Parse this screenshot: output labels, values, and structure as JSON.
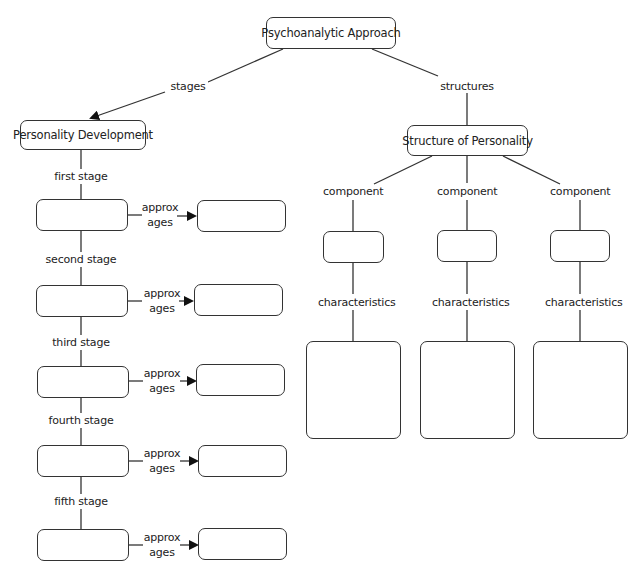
{
  "diagram": {
    "type": "concept-map",
    "root": {
      "label": "Psychoanalytic Approach"
    },
    "links": {
      "left": "stages",
      "right": "structures"
    },
    "left_branch": {
      "title": "Personality Development",
      "age_link_label_line1": "approx",
      "age_link_label_line2": "ages",
      "stages": [
        {
          "link_label": "first stage",
          "stage_value": "",
          "age_value": ""
        },
        {
          "link_label": "second stage",
          "stage_value": "",
          "age_value": ""
        },
        {
          "link_label": "third stage",
          "stage_value": "",
          "age_value": ""
        },
        {
          "link_label": "fourth stage",
          "stage_value": "",
          "age_value": ""
        },
        {
          "link_label": "fifth stage",
          "stage_value": "",
          "age_value": ""
        }
      ]
    },
    "right_branch": {
      "title": "Structure of Personality",
      "components": [
        {
          "link_label": "component",
          "component_value": "",
          "characteristics_label": "characteristics",
          "characteristics_value": ""
        },
        {
          "link_label": "component",
          "component_value": "",
          "characteristics_label": "characteristics",
          "characteristics_value": ""
        },
        {
          "link_label": "component",
          "component_value": "",
          "characteristics_label": "characteristics",
          "characteristics_value": ""
        }
      ]
    },
    "colors": {
      "line": "#333333",
      "box_border": "#333333",
      "background": "#ffffff",
      "text": "#222222"
    }
  }
}
